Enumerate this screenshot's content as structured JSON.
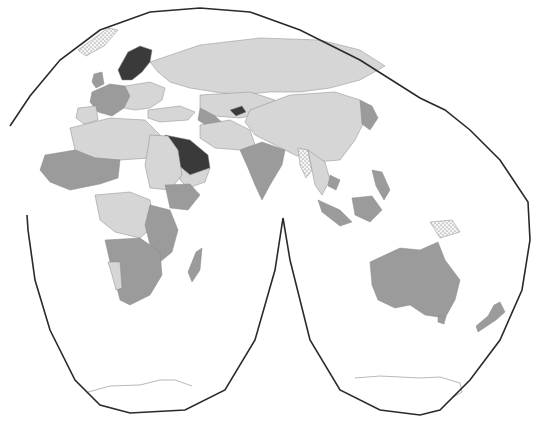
{
  "map": {
    "type": "choropleth",
    "projection": "interrupted-goode-like",
    "colors": {
      "background": "#ffffff",
      "outline": "#2a2a2a",
      "class_light": "#d6d6d6",
      "class_medium": "#9b9b9b",
      "class_dark": "#3a3a3a",
      "class_nodata_dotted": "#f4f4f4",
      "border": "#8a8a8a"
    },
    "classes": [
      {
        "id": "light",
        "color": "#d6d6d6"
      },
      {
        "id": "medium",
        "color": "#9b9b9b"
      },
      {
        "id": "dark",
        "color": "#3a3a3a"
      },
      {
        "id": "dotted",
        "color": "#f4f4f4"
      }
    ],
    "regions": [
      {
        "name": "russia",
        "class": "light",
        "d": "M150,62 L200,45 L260,38 L320,40 L360,50 L385,66 L360,80 L330,88 L300,92 L270,92 L240,95 L215,92 L190,88 L170,82 L158,72 Z"
      },
      {
        "name": "scandinavia",
        "class": "dark",
        "d": "M118,70 L128,52 L140,46 L152,50 L150,62 L142,72 L132,80 L122,80 Z"
      },
      {
        "name": "western-europe",
        "class": "medium",
        "d": "M92,92 L110,84 L125,86 L130,96 L124,108 L112,116 L98,112 L90,102 Z"
      },
      {
        "name": "central-europe",
        "class": "light",
        "d": "M125,86 L150,82 L165,88 L162,100 L150,108 L135,110 L124,108 L130,96 Z"
      },
      {
        "name": "uk",
        "class": "medium",
        "d": "M94,74 L102,72 L104,84 L96,88 L92,82 Z"
      },
      {
        "name": "iberia",
        "class": "light",
        "d": "M78,108 L96,106 L98,120 L84,124 L76,118 Z"
      },
      {
        "name": "turkey-caucasus",
        "class": "light",
        "d": "M148,110 L180,106 L195,112 L188,120 L160,122 L148,118 Z"
      },
      {
        "name": "kazakhstan-central-asia",
        "class": "light",
        "d": "M200,95 L250,92 L275,100 L270,112 L240,118 L215,116 L200,108 Z"
      },
      {
        "name": "kyrgyzstan",
        "class": "dark",
        "d": "M230,110 L242,106 L246,112 L236,116 Z"
      },
      {
        "name": "turkmenistan-uzbek",
        "class": "medium",
        "d": "M200,108 L215,116 L225,125 L210,128 L198,120 Z"
      },
      {
        "name": "china-mongolia",
        "class": "light",
        "d": "M250,110 L290,95 L335,92 L360,100 L365,120 L355,140 L340,160 L315,162 L295,155 L275,145 L255,135 L245,122 Z"
      },
      {
        "name": "iran-afghan-pakistan",
        "class": "light",
        "d": "M200,125 L230,120 L250,130 L255,145 L240,150 L215,148 L200,138 Z"
      },
      {
        "name": "india",
        "class": "medium",
        "d": "M240,150 L262,142 L285,150 L282,165 L270,185 L262,200 L255,185 L248,168 Z"
      },
      {
        "name": "saudi-arabia",
        "class": "dark",
        "d": "M165,135 L190,140 L208,155 L210,168 L190,175 L178,165 L168,150 Z"
      },
      {
        "name": "arabia-rest",
        "class": "light",
        "d": "M178,165 L190,175 L210,168 L205,182 L188,188 L180,180 Z"
      },
      {
        "name": "myanmar",
        "class": "dotted",
        "d": "M298,148 L308,150 L312,170 L306,178 L300,165 Z"
      },
      {
        "name": "southeast-asia",
        "class": "light",
        "d": "M308,150 L325,162 L330,180 L322,195 L315,185 L312,170 Z"
      },
      {
        "name": "cambodia",
        "class": "medium",
        "d": "M330,175 L340,180 L336,190 L328,186 Z"
      },
      {
        "name": "japan-korea",
        "class": "medium",
        "d": "M360,100 L372,106 L378,118 L370,130 L362,124 Z"
      },
      {
        "name": "indonesia-sumatra",
        "class": "medium",
        "d": "M318,200 L340,210 L352,222 L340,226 L322,212 Z"
      },
      {
        "name": "borneo-sulawesi",
        "class": "medium",
        "d": "M352,198 L372,196 L382,210 L370,222 L355,215 Z"
      },
      {
        "name": "philippines",
        "class": "medium",
        "d": "M372,170 L382,172 L390,190 L384,200 L376,186 Z"
      },
      {
        "name": "papua-new-guinea",
        "class": "dotted",
        "d": "M430,222 L452,220 L460,232 L440,238 Z"
      },
      {
        "name": "north-africa-west",
        "class": "light",
        "d": "M70,128 L110,118 L145,120 L160,135 L165,150 L150,158 L120,160 L95,158 L75,150 Z"
      },
      {
        "name": "west-africa-sahel",
        "class": "medium",
        "d": "M45,155 L75,150 L95,158 L120,160 L118,178 L100,184 L70,190 L50,182 L40,170 Z"
      },
      {
        "name": "egypt-sudan",
        "class": "light",
        "d": "M150,135 L168,136 L178,150 L182,175 L170,190 L150,188 L145,165 L148,148 Z"
      },
      {
        "name": "ethiopia-horn",
        "class": "medium",
        "d": "M165,185 L190,184 L200,195 L188,210 L170,208 Z"
      },
      {
        "name": "central-africa",
        "class": "light",
        "d": "M95,195 L130,192 L150,200 L155,225 L140,238 L115,232 L100,220 Z"
      },
      {
        "name": "east-africa",
        "class": "medium",
        "d": "M150,205 L170,210 L178,230 L172,252 L160,262 L150,245 L145,225 Z"
      },
      {
        "name": "southern-africa",
        "class": "medium",
        "d": "M105,240 L140,238 L160,252 L162,275 L150,295 L130,305 L120,300 L115,280 L110,262 Z"
      },
      {
        "name": "namibia",
        "class": "light",
        "d": "M108,262 L120,262 L122,288 L116,290 L112,275 Z"
      },
      {
        "name": "madagascar",
        "class": "medium",
        "d": "M196,252 L202,248 L200,270 L192,282 L188,272 Z"
      },
      {
        "name": "australia",
        "class": "medium",
        "d": "M370,262 L400,248 L420,250 L438,242 L445,260 L460,280 L455,300 L445,318 L425,315 L410,305 L395,308 L378,300 L372,285 Z"
      },
      {
        "name": "tasmania",
        "class": "medium",
        "d": "M438,316 L446,316 L444,324 L438,322 Z"
      },
      {
        "name": "new-zealand",
        "class": "medium",
        "d": "M494,305 L500,302 L505,312 L496,320 L478,332 L476,326 L488,316 Z"
      },
      {
        "name": "greenland-iceland",
        "class": "dotted",
        "d": "M78,50 L108,28 L118,30 L104,46 L86,56 Z"
      }
    ],
    "antarctica": [
      {
        "name": "antarctica-west",
        "d": "M88,392 L110,386 L140,385 L160,380 L175,380 L192,386"
      },
      {
        "name": "antarctica-east",
        "d": "M355,378 L380,376 L420,378 L440,377 L460,383 L462,392 L452,398"
      }
    ],
    "outline": {
      "left_lobe": "M10,126 L30,96 L60,60 L100,30 L150,12 L200,8 L250,12 L300,30 L360,60 L420,98 L445,110 L470,130 L500,160 L528,202 L530,240 L522,290 L500,340 L470,380 L440,410 L420,415 L380,410 L340,390 L310,340 L290,260 L283,218 L275,270 L255,340 L225,390 L185,410 L130,413 L100,405 L75,380 L50,330 L35,280 L28,230 L27,215"
    }
  }
}
